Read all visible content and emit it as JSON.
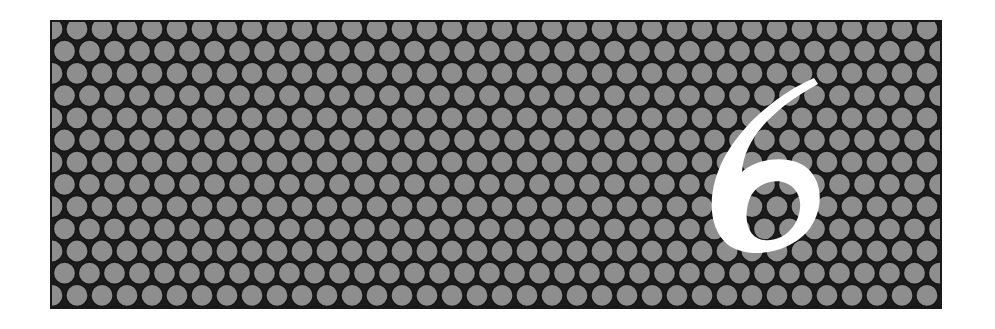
{
  "banner": {
    "numeral": "6",
    "colors": {
      "background": "#1c1c1c",
      "circle_fill": "#8e8e8e",
      "circle_stroke": "#161616",
      "numeral_fill": "#ffffff",
      "page": "#ffffff"
    },
    "pattern": {
      "type": "hexagonal-circle-grid",
      "spacing_x": 25,
      "spacing_y": 22.2,
      "radius": 11.2
    }
  }
}
